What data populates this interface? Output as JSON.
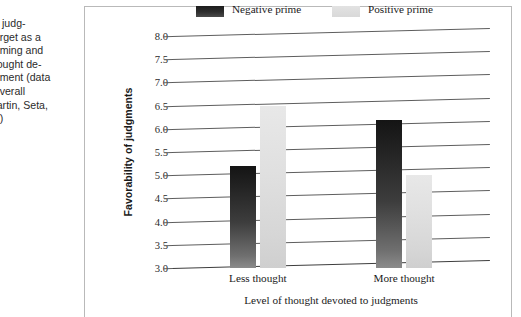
{
  "caption": {
    "figure_number": "7",
    "lines": [
      "y of judg-",
      "a target as a",
      "f priming and",
      "f thought de-",
      "udgment (data",
      "te overall",
      "f Martin, Seta,",
      "990)"
    ]
  },
  "legend": {
    "negative_label": "Negative prime",
    "positive_label": "Positive prime",
    "negative_color": "#242424",
    "positive_color": "#dcdcdc"
  },
  "chart_data": {
    "type": "bar",
    "title": "",
    "categories": [
      "Less thought",
      "More thought"
    ],
    "series": [
      {
        "name": "Negative prime",
        "values": [
          5.2,
          6.2
        ],
        "color": "#242424"
      },
      {
        "name": "Positive prime",
        "values": [
          6.5,
          5.0
        ],
        "color": "#dcdcdc"
      }
    ],
    "xlabel": "Level of thought devoted to judgments",
    "ylabel": "Favorability of judgments",
    "ylim": [
      3.0,
      8.0
    ],
    "ytick_step": 0.5,
    "yticks": [
      "8.0",
      "7.5",
      "7.0",
      "6.5",
      "6.0",
      "5.5",
      "5.0",
      "4.5",
      "4.0",
      "3.5",
      "3.0"
    ],
    "grid": true,
    "legend_position": "top"
  }
}
